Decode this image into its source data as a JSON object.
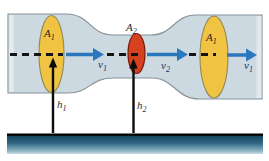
{
  "diagram": {
    "name": "venturi-tube-flow-diagram",
    "labels": {
      "area_left": {
        "base": "A",
        "sub": "1"
      },
      "area_throat": {
        "base": "A",
        "sub": "2"
      },
      "area_right": {
        "base": "A",
        "sub": "1"
      },
      "velocity_1": {
        "base": "v",
        "sub": "1"
      },
      "velocity_2": {
        "base": "v",
        "sub": "2"
      },
      "velocity_exit": {
        "base": "v",
        "sub": "1"
      },
      "height_1": {
        "base": "h",
        "sub": "1"
      },
      "height_2": {
        "base": "h",
        "sub": "2"
      }
    },
    "colors": {
      "background": "#ffffff",
      "pipe_fill": "#cdd9e0",
      "pipe_end_highlight": "#e2eaee",
      "pipe_outline": "#87929a",
      "cross_section_wide_fill": "#f0c342",
      "cross_section_wide_outline": "#8f8a58",
      "cross_section_throat_fill": "#d64120",
      "cross_section_throat_outline": "#7a1d0e",
      "flow_arrow": "#2b77be",
      "axis_dash": "#141414",
      "height_arrow": "#0c0c0c",
      "ground_edge_line": "#000000",
      "ground_top": "#0f3d55",
      "ground_mid": "#2e6583",
      "ground_light": "#8fb5c3",
      "ground_fade": "#c9dbe1",
      "label_area": "#262626",
      "label_velocity": "#16365a",
      "label_height": "#33312e"
    }
  }
}
